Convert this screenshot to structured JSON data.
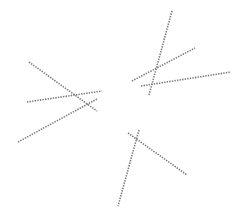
{
  "canvas": {
    "width": 249,
    "height": 222,
    "background": "#ffffff"
  },
  "style": {
    "stroke": "#7a7a7a",
    "stroke_width": 1.6,
    "dash": "1.4 1.2"
  },
  "clusters": [
    {
      "name": "left-cluster",
      "lines": [
        {
          "id": "A",
          "x1": 29,
          "y1": 62,
          "x2": 97,
          "y2": 111
        },
        {
          "id": "B",
          "x1": 27,
          "y1": 102,
          "x2": 102,
          "y2": 91
        },
        {
          "id": "C",
          "x1": 18,
          "y1": 142,
          "x2": 97,
          "y2": 99
        }
      ]
    },
    {
      "name": "top-right-cluster",
      "lines": [
        {
          "id": "D",
          "x1": 172,
          "y1": 11,
          "x2": 149,
          "y2": 95
        },
        {
          "id": "E",
          "x1": 132,
          "y1": 81,
          "x2": 195,
          "y2": 48
        },
        {
          "id": "F",
          "x1": 141,
          "y1": 86,
          "x2": 231,
          "y2": 72
        }
      ]
    },
    {
      "name": "bottom-cluster",
      "lines": [
        {
          "id": "G",
          "x1": 139,
          "y1": 130,
          "x2": 118,
          "y2": 206
        },
        {
          "id": "H",
          "x1": 128,
          "y1": 133,
          "x2": 187,
          "y2": 175
        }
      ]
    }
  ]
}
